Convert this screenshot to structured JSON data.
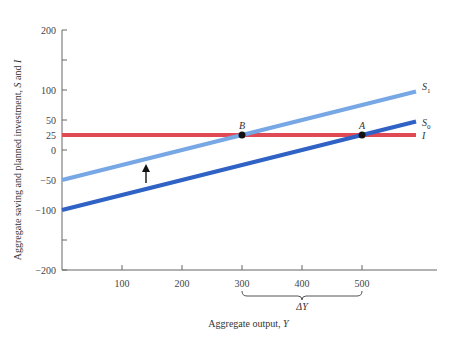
{
  "chart_data": {
    "type": "line",
    "title": "",
    "xlabel": "Aggregate output, Y",
    "ylabel": "Aggregate saving and planned investment, S and I",
    "xlim": [
      0,
      600
    ],
    "ylim": [
      -200,
      200
    ],
    "x_ticks": [
      100,
      200,
      300,
      400,
      500
    ],
    "y_ticks": [
      200,
      150,
      100,
      50,
      25,
      0,
      -50,
      -100,
      -150,
      -200
    ],
    "y_tick_labels": [
      "200",
      "",
      "100",
      "50",
      "25",
      "0",
      "-50",
      "-100",
      "",
      "-200"
    ],
    "x_tick_labels": [
      "100",
      "200",
      "300",
      "400",
      "500"
    ],
    "grid": false,
    "series": [
      {
        "name": "S0",
        "label": "S",
        "subscript": "0",
        "color": "#2f62c4",
        "x": [
          0,
          590
        ],
        "y": [
          -100,
          47.5
        ]
      },
      {
        "name": "S1",
        "label": "S",
        "subscript": "1",
        "color": "#78a8e4",
        "x": [
          0,
          590
        ],
        "y": [
          -50,
          97.5
        ]
      },
      {
        "name": "I",
        "label": "I",
        "subscript": "",
        "color": "#e04a55",
        "x": [
          0,
          590
        ],
        "y": [
          25,
          25
        ]
      }
    ],
    "points": [
      {
        "label": "A",
        "x": 500,
        "y": 25
      },
      {
        "label": "B",
        "x": 300,
        "y": 25
      }
    ],
    "annotations": {
      "shift_arrow": {
        "x": 140,
        "from": -55,
        "to": -25,
        "meaning": "S shifts up"
      },
      "brace": {
        "from": 300,
        "to": 500,
        "label": "ΔY"
      }
    }
  }
}
